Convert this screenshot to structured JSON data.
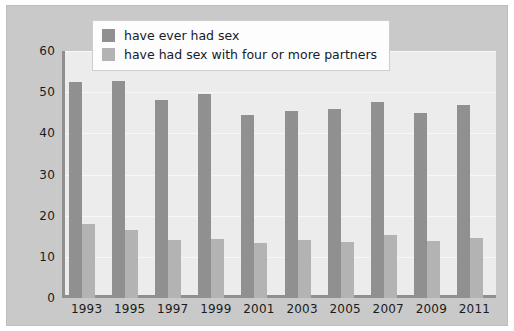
{
  "chart_data": {
    "type": "bar",
    "title": "",
    "subtitle": "",
    "xlabel": "",
    "ylabel": "",
    "categories": [
      "1993",
      "1995",
      "1997",
      "1999",
      "2001",
      "2003",
      "2005",
      "2007",
      "2009",
      "2011"
    ],
    "series": [
      {
        "name": "have ever had sex",
        "color": "#909090",
        "values": [
          52.5,
          52.8,
          48.0,
          49.5,
          44.5,
          45.5,
          46.0,
          47.5,
          45.0,
          47.0
        ]
      },
      {
        "name": "have had sex with four or more partners",
        "color": "#b3b3b3",
        "values": [
          18.0,
          16.5,
          14.2,
          14.3,
          13.4,
          14.0,
          13.6,
          15.2,
          13.9,
          14.7
        ]
      }
    ],
    "ylim": [
      0,
      60
    ],
    "yticks": [
      0,
      10,
      20,
      30,
      40,
      50,
      60
    ],
    "ytick_labels": [
      "0",
      "10",
      "20",
      "30",
      "40",
      "50",
      "60"
    ],
    "grid": true,
    "legend_position": "top-left-inside"
  },
  "legend": {
    "entries": [
      {
        "label": "have ever had sex"
      },
      {
        "label": "have had sex with four or more partners"
      }
    ]
  },
  "colors": {
    "series_dark": "#909090",
    "series_light": "#b3b3b3",
    "plot_background": "#ececec",
    "figure_background": "#c9c9c9",
    "axis": "#8f8f8f",
    "text": "#1b1b1b"
  }
}
